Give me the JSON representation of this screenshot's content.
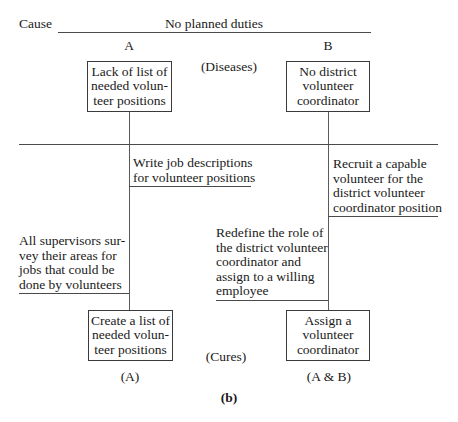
{
  "header": {
    "cause_label": "Cause",
    "cause_text": "No planned duties",
    "column_a": "A",
    "column_b": "B"
  },
  "diseases": {
    "label": "(Diseases)",
    "box_a": "Lack of list of\nneeded volun-\nteer positions",
    "box_b": "No district\nvolunteer\ncoordinator"
  },
  "steps": {
    "write_job": "Write job descriptions\nfor volunteer positions",
    "recruit": "Recruit a capable\nvolunteer for the\ndistrict volunteer\ncoordinator position",
    "supervisors": "All supervisors sur-\nvey their areas for\njobs that could be\ndone by volunteers",
    "redefine": "Redefine the role of\nthe district volunteer\ncoordinator and\nassign to a willing\nemployee"
  },
  "cures": {
    "label": "(Cures)",
    "box_a": "Create a list of\nneeded volun-\nteer positions",
    "box_b": "Assign a\nvolunteer\ncoordinator",
    "tag_a": "(A)",
    "tag_b": "(A & B)"
  },
  "caption": "(b)"
}
